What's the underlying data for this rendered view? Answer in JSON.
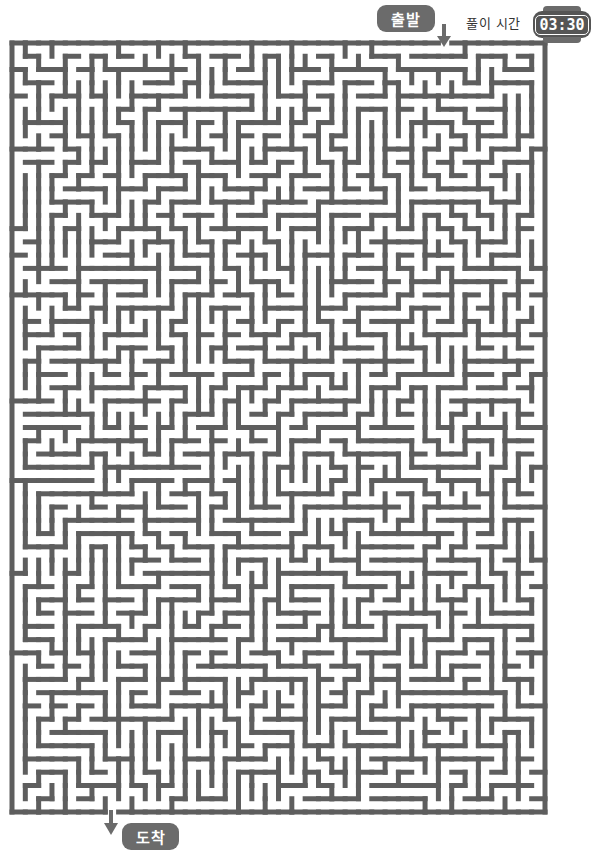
{
  "header": {
    "start_label": "출발",
    "time_label": "풀이 시간",
    "time_value": "03:30"
  },
  "footer": {
    "end_label": "도착"
  },
  "maze": {
    "cols": 40,
    "rows": 58,
    "origin_x": 12,
    "origin_y": 43,
    "width": 533,
    "height": 769,
    "wall_thickness": 5,
    "entrance_col": 32,
    "exit_col": 7,
    "seed": 20240530,
    "wall_color": "#5e5e5e",
    "background_color": "#ffffff"
  },
  "colors": {
    "badge": "#6b6b6b",
    "arrow": "#6b6b6b",
    "text": "#333333"
  },
  "icons": {
    "start_arrow": "arrow-down-icon",
    "end_arrow": "arrow-down-icon",
    "watch": "smartwatch-icon"
  }
}
